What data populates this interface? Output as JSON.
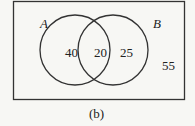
{
  "diagram": {
    "type": "venn",
    "sets": [
      {
        "name": "A",
        "only": "40"
      },
      {
        "name": "B",
        "only": "25"
      }
    ],
    "intersection": "20",
    "outside": "55",
    "caption": "(b)"
  },
  "colors": {
    "stroke": "#333333",
    "background": "#f7f7f4"
  }
}
